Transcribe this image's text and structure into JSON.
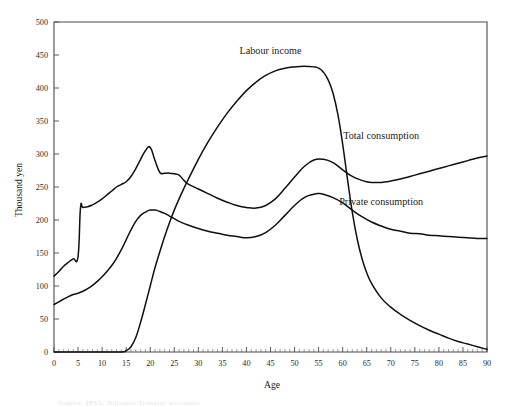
{
  "chart_data": {
    "type": "line",
    "title": "",
    "xlabel": "Age",
    "ylabel": "Thousand yen",
    "xlim": [
      0,
      90
    ],
    "ylim": [
      0,
      500
    ],
    "xticks": [
      0,
      5,
      10,
      15,
      20,
      25,
      30,
      35,
      40,
      45,
      50,
      55,
      60,
      65,
      70,
      75,
      80,
      85,
      90
    ],
    "yticks": [
      0,
      50,
      100,
      150,
      200,
      250,
      300,
      350,
      400,
      450,
      500
    ],
    "grid": false,
    "legend_position": "inline-annotations",
    "series": [
      {
        "name": "Labour income",
        "label_x": 45,
        "label_y": 452,
        "x": [
          0,
          5,
          10,
          14,
          15,
          16,
          17,
          18,
          19,
          20,
          21,
          22,
          23,
          24,
          25,
          26,
          27,
          28,
          30,
          32,
          34,
          36,
          38,
          40,
          42,
          44,
          46,
          48,
          50,
          52,
          54,
          55,
          56,
          57,
          58,
          59,
          60,
          61,
          62,
          63,
          64,
          65,
          66,
          68,
          70,
          72,
          74,
          76,
          78,
          80,
          82,
          84,
          86,
          88,
          90
        ],
        "values": [
          0,
          0,
          0,
          0,
          2,
          8,
          22,
          45,
          72,
          100,
          128,
          152,
          175,
          196,
          215,
          232,
          248,
          263,
          292,
          318,
          341,
          362,
          380,
          396,
          409,
          419,
          426,
          430,
          432,
          433,
          432,
          430,
          424,
          412,
          392,
          360,
          315,
          262,
          212,
          172,
          142,
          120,
          104,
          82,
          68,
          57,
          48,
          40,
          33,
          27,
          21,
          16,
          12,
          8,
          4
        ]
      },
      {
        "name": "Total consumption",
        "label_x": 68,
        "label_y": 323,
        "x": [
          0,
          1,
          2,
          3,
          4,
          5,
          5.5,
          6,
          7,
          8,
          9,
          10,
          11,
          12,
          13,
          14,
          15,
          16,
          17,
          18,
          19,
          20,
          21,
          22,
          23,
          24,
          25,
          26,
          27,
          28,
          30,
          32,
          34,
          36,
          38,
          40,
          42,
          44,
          46,
          48,
          50,
          52,
          54,
          56,
          58,
          60,
          62,
          64,
          65,
          66,
          68,
          70,
          72,
          74,
          76,
          78,
          80,
          82,
          84,
          86,
          88,
          90
        ],
        "values": [
          115,
          122,
          130,
          136,
          141,
          145,
          218,
          219,
          220,
          223,
          227,
          232,
          238,
          244,
          250,
          254,
          258,
          266,
          278,
          292,
          305,
          310,
          290,
          272,
          271,
          271,
          270,
          268,
          260,
          254,
          247,
          240,
          233,
          227,
          222,
          219,
          218,
          222,
          232,
          248,
          265,
          281,
          291,
          292,
          287,
          276,
          266,
          260,
          258,
          257,
          257,
          259,
          262,
          266,
          270,
          274,
          278,
          282,
          286,
          290,
          294,
          297
        ]
      },
      {
        "name": "Private consumption",
        "label_x": 68,
        "label_y": 222,
        "x": [
          0,
          1,
          2,
          3,
          4,
          5,
          6,
          7,
          8,
          9,
          10,
          11,
          12,
          13,
          14,
          15,
          16,
          17,
          18,
          19,
          20,
          21,
          22,
          23,
          24,
          25,
          26,
          28,
          30,
          32,
          34,
          36,
          38,
          40,
          42,
          44,
          46,
          48,
          50,
          52,
          54,
          55,
          56,
          58,
          60,
          62,
          64,
          66,
          68,
          70,
          72,
          74,
          76,
          78,
          80,
          82,
          84,
          86,
          88,
          90
        ],
        "values": [
          72,
          76,
          80,
          84,
          87,
          89,
          92,
          96,
          101,
          107,
          114,
          122,
          131,
          142,
          155,
          170,
          185,
          198,
          207,
          212,
          215,
          215,
          213,
          210,
          206,
          202,
          198,
          192,
          187,
          183,
          180,
          177,
          175,
          173,
          175,
          181,
          192,
          207,
          222,
          234,
          239,
          240,
          239,
          234,
          226,
          215,
          205,
          197,
          191,
          186,
          183,
          180,
          179,
          177,
          176,
          175,
          174,
          173,
          172,
          172
        ]
      }
    ],
    "axis_titles": {
      "x": "Age",
      "y": "Thousand yen"
    },
    "caption_partial": "Source: IPSS, National Transfer Accounts"
  }
}
